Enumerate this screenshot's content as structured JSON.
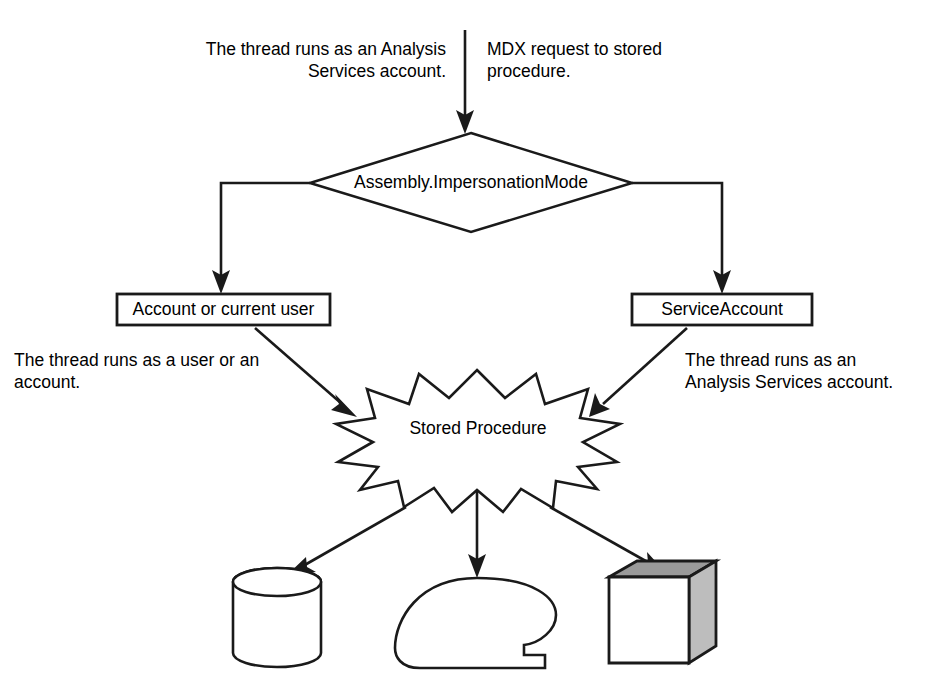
{
  "diagram": {
    "type": "flowchart",
    "background_color": "#ffffff",
    "line_color": "#1a1a1a",
    "captions": {
      "top_left": "The thread runs as an Analysis Services account.",
      "top_right": "MDX request to stored procedure.",
      "bottom_left": "The thread runs as a user or an account.",
      "bottom_right": "The thread runs as an Analysis Services account."
    },
    "nodes": {
      "decision": {
        "label": "Assembly.ImpersonationMode",
        "shape": "diamond"
      },
      "branch_left": {
        "label": "Account or current user",
        "shape": "rectangle"
      },
      "branch_right": {
        "label": "ServiceAccount",
        "shape": "rectangle"
      },
      "stored_procedure": {
        "label": "Stored Procedure",
        "shape": "starburst"
      },
      "target_database": {
        "label": "",
        "shape": "cylinder"
      },
      "target_loop": {
        "label": "",
        "shape": "stored-data-loop"
      },
      "target_cube": {
        "label": "",
        "shape": "cube"
      }
    },
    "edges": [
      {
        "from": "request",
        "to": "decision",
        "style": "straight-down-arrow"
      },
      {
        "from": "decision",
        "to": "branch_left",
        "style": "elbow-left-arrow"
      },
      {
        "from": "decision",
        "to": "branch_right",
        "style": "elbow-right-arrow"
      },
      {
        "from": "branch_left",
        "to": "stored_procedure",
        "style": "diagonal-arrow"
      },
      {
        "from": "branch_right",
        "to": "stored_procedure",
        "style": "diagonal-arrow"
      },
      {
        "from": "stored_procedure",
        "to": "target_database",
        "style": "diagonal-arrow"
      },
      {
        "from": "stored_procedure",
        "to": "target_loop",
        "style": "straight-down-arrow"
      },
      {
        "from": "stored_procedure",
        "to": "target_cube",
        "style": "diagonal-arrow"
      }
    ]
  }
}
